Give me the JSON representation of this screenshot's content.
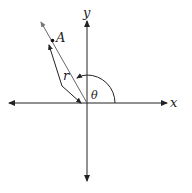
{
  "diagram": {
    "type": "polar-angle-figure",
    "labels": {
      "x_axis": "x",
      "y_axis": "y",
      "point": "A",
      "radius": "r",
      "angle": "θ"
    },
    "colors": {
      "axis": "#222222",
      "ray": "#555555",
      "background": "#ffffff"
    }
  }
}
